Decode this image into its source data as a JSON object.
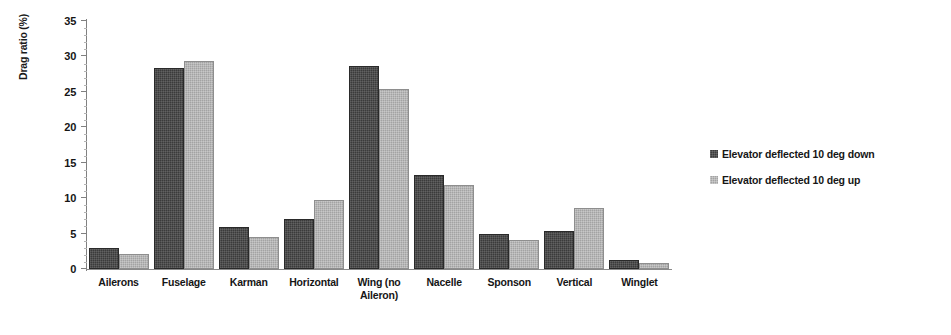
{
  "chart_data": {
    "type": "bar",
    "title": "",
    "xlabel": "",
    "ylabel": "Drag ratio (%)",
    "ylim": [
      0,
      35
    ],
    "ytick_labels": [
      "0",
      "5",
      "10",
      "15",
      "20",
      "25",
      "30",
      "35"
    ],
    "ytick_values": [
      0,
      5,
      10,
      15,
      20,
      25,
      30,
      35
    ],
    "grid": false,
    "legend_position": "right",
    "categories": [
      "Ailerons",
      "Fuselage",
      "Karman",
      "Horizontal",
      "Wing (no Aileron)",
      "Nacelle",
      "Sponson",
      "Vertical",
      "Winglet"
    ],
    "category_lines": [
      [
        "Ailerons"
      ],
      [
        "Fuselage"
      ],
      [
        "Karman"
      ],
      [
        "Horizontal"
      ],
      [
        "Wing (no",
        "Aileron)"
      ],
      [
        "Nacelle"
      ],
      [
        "Sponson"
      ],
      [
        "Vertical"
      ],
      [
        "Winglet"
      ]
    ],
    "series": [
      {
        "name": "Elevator deflected 10 deg down",
        "color": "#3b3b3b",
        "values": [
          3.0,
          28.3,
          6.0,
          7.1,
          28.6,
          13.3,
          5.0,
          5.4,
          1.3
        ]
      },
      {
        "name": "Elevator deflected 10 deg up",
        "color": "#a3a3a3",
        "values": [
          2.1,
          29.3,
          4.5,
          9.8,
          25.4,
          11.8,
          4.1,
          8.6,
          0.8
        ]
      }
    ]
  },
  "legend": {
    "items": [
      {
        "label": "Elevator deflected 10 deg down",
        "swatch": "swatch-dark"
      },
      {
        "label": "Elevator deflected 10 deg up",
        "swatch": "swatch-light"
      }
    ]
  }
}
